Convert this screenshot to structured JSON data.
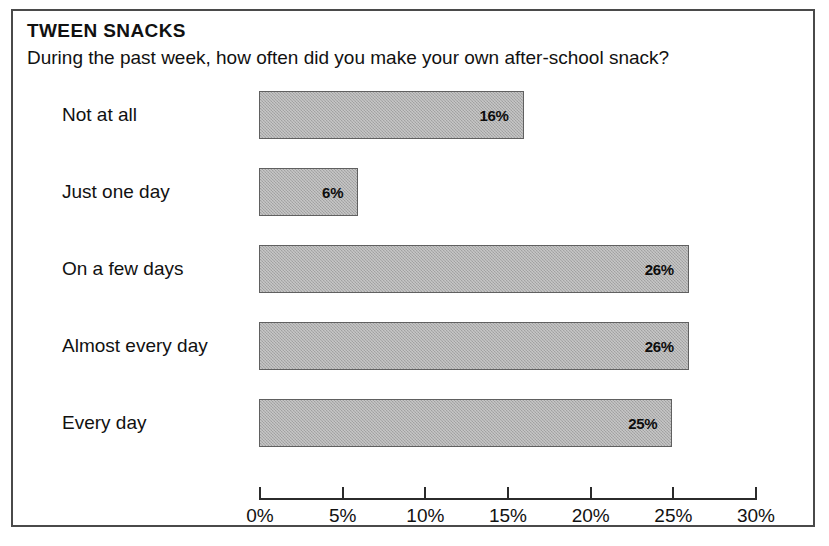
{
  "chart_data": {
    "type": "bar",
    "orientation": "horizontal",
    "title": "TWEEN SNACKS",
    "subtitle": "During the past week, how often did you make your own after-school snack?",
    "categories": [
      "Not at all",
      "Just one day",
      "On a few days",
      "Almost every day",
      "Every day"
    ],
    "values": [
      16,
      6,
      26,
      26,
      25
    ],
    "value_labels": [
      "16%",
      "6%",
      "26%",
      "26%",
      "25%"
    ],
    "xlabel": "",
    "ylabel": "",
    "xlim": [
      0,
      30
    ],
    "xticks": [
      0,
      5,
      10,
      15,
      20,
      25,
      30
    ],
    "xtick_labels": [
      "0%",
      "5%",
      "10%",
      "15%",
      "20%",
      "25%",
      "30%"
    ],
    "grid": false,
    "legend": false,
    "bar_fill_color": "#adadad",
    "bar_border_color": "#606060",
    "axis_color": "#2b2b2b",
    "frame_color": "#4a4a4a",
    "text_color": "#111111"
  }
}
